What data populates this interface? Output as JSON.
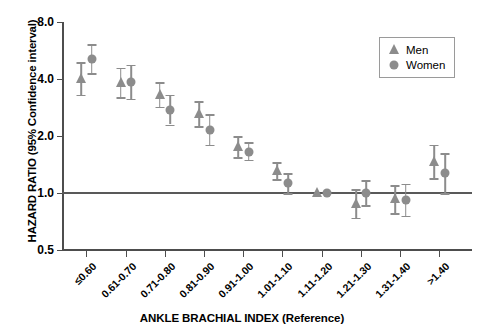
{
  "chart_data": {
    "type": "scatter",
    "title": "",
    "xlabel": "ANKLE BRACHIAL INDEX (Reference)",
    "ylabel": "HAZARD RATIO (95% Confidence interval)",
    "yscale": "log",
    "ylim": [
      0.5,
      8.0
    ],
    "yticks": [
      0.5,
      1.0,
      2.0,
      4.0,
      8.0
    ],
    "ytick_labels": [
      "0.5",
      "1.0",
      "2.0",
      "4.0",
      "8.0"
    ],
    "grid": false,
    "reference_line": 1.0,
    "legend_position": "top-right",
    "categories": [
      "≤0.60",
      "0.61-0.70",
      "0.71-0.80",
      "0.81-0.90",
      "0.91-1.00",
      "1.01-1.10",
      "1.11-1.20",
      "1.21-1.30",
      "1.31-1.40",
      ">1.40"
    ],
    "series": [
      {
        "name": "Men",
        "marker": "triangle",
        "color": "#8c8c8c",
        "values": [
          4.0,
          3.8,
          3.3,
          2.6,
          1.75,
          1.3,
          1.0,
          0.88,
          0.93,
          1.45
        ],
        "ci_low": [
          3.3,
          3.2,
          2.85,
          2.25,
          1.55,
          1.18,
          1.0,
          0.74,
          0.78,
          1.2
        ],
        "ci_high": [
          4.9,
          4.6,
          3.85,
          3.05,
          2.0,
          1.45,
          1.0,
          1.05,
          1.1,
          1.8
        ]
      },
      {
        "name": "Women",
        "marker": "circle",
        "color": "#8c8c8c",
        "values": [
          5.1,
          3.85,
          2.75,
          2.15,
          1.65,
          1.13,
          1.0,
          1.0,
          0.92,
          1.28
        ],
        "ci_low": [
          4.3,
          3.15,
          2.3,
          1.8,
          1.5,
          1.0,
          1.0,
          0.86,
          0.76,
          1.0
        ],
        "ci_high": [
          6.1,
          4.75,
          3.3,
          2.6,
          1.85,
          1.27,
          1.0,
          1.17,
          1.12,
          1.62
        ]
      }
    ]
  },
  "legend": {
    "items": [
      {
        "label": "Men",
        "marker": "triangle"
      },
      {
        "label": "Women",
        "marker": "circle"
      }
    ]
  }
}
